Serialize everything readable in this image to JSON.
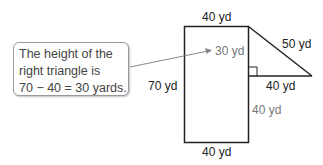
{
  "figure": {
    "type": "composite-figure",
    "shapes": [
      "rectangle",
      "right-triangle"
    ],
    "labels": {
      "rect_top": "40 yd",
      "rect_left": "70 yd",
      "rect_bottom": "40 yd",
      "rect_right_lower": "40 yd",
      "triangle_height": "30 yd",
      "triangle_base": "40 yd",
      "triangle_hypotenuse": "50 yd"
    }
  },
  "callout": {
    "lines": [
      "The height of the",
      "right triangle is",
      "70 − 40 = 30 yards."
    ]
  },
  "colors": {
    "outline": "#222222",
    "annotation": "#777777",
    "callout_border": "#999999"
  }
}
